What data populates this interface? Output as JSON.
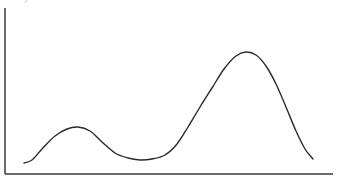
{
  "chart_data": {
    "type": "line",
    "title": "",
    "xlabel": "",
    "ylabel": "",
    "grid": false,
    "legend": null,
    "ticks": false,
    "points_px": [
      [
        24,
        163
      ],
      [
        32,
        160
      ],
      [
        42,
        149
      ],
      [
        55,
        136
      ],
      [
        67,
        129
      ],
      [
        78,
        127
      ],
      [
        90,
        131
      ],
      [
        102,
        142
      ],
      [
        115,
        153
      ],
      [
        128,
        158
      ],
      [
        140,
        160
      ],
      [
        152,
        159
      ],
      [
        165,
        155
      ],
      [
        177,
        144
      ],
      [
        188,
        127
      ],
      [
        200,
        107
      ],
      [
        212,
        88
      ],
      [
        224,
        69
      ],
      [
        236,
        56
      ],
      [
        246,
        52
      ],
      [
        256,
        55
      ],
      [
        266,
        66
      ],
      [
        276,
        84
      ],
      [
        286,
        107
      ],
      [
        296,
        131
      ],
      [
        305,
        149
      ],
      [
        313,
        159
      ]
    ],
    "series": [
      {
        "name": "curve",
        "x": [
          0,
          1,
          2,
          3,
          4,
          5,
          6,
          7,
          8,
          9,
          10,
          11,
          12,
          13,
          14,
          15,
          16,
          17,
          18,
          19,
          20,
          21,
          22,
          23,
          24,
          25,
          26
        ],
        "values": [
          0.1,
          0.12,
          0.22,
          0.33,
          0.4,
          0.42,
          0.38,
          0.28,
          0.18,
          0.14,
          0.12,
          0.13,
          0.16,
          0.26,
          0.41,
          0.59,
          0.76,
          0.93,
          1.04,
          1.08,
          1.05,
          0.95,
          0.79,
          0.58,
          0.37,
          0.21,
          0.12
        ]
      }
    ],
    "axes": {
      "x_axis": {
        "x1": 5,
        "x2": 333,
        "y": 174
      },
      "y_axis": {
        "x": 5,
        "y1": 8,
        "y2": 174
      }
    },
    "colors": {
      "curve": "#2a2a2a",
      "axis": "#3a3a3a",
      "background": "#ffffff"
    }
  },
  "labels": {
    "cropped_top": "y"
  }
}
